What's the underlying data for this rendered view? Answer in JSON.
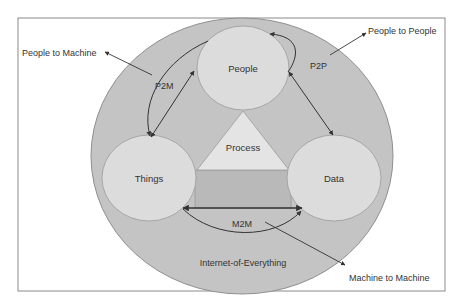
{
  "diagram": {
    "title": "Internet-of-Everything",
    "nodes": {
      "people": "People",
      "things": "Things",
      "data": "Data",
      "process": "Process"
    },
    "connections": {
      "p2m": "P2M",
      "p2p": "P2P",
      "m2m": "M2M"
    },
    "callouts": {
      "people_to_machine": "People to Machine",
      "people_to_people": "People to People",
      "machine_to_machine": "Machine to Machine"
    },
    "colors": {
      "background": "#ffffff",
      "frame": "#8a8a8a",
      "outer_ellipse": "#c4c4c4",
      "outer_stroke": "#8f8f8f",
      "node_fill": "#dcdcdc",
      "triangle_fill": "#e4e4e4",
      "rect_fill": "#b9b9b9",
      "arrow": "#333333",
      "text": "#333333"
    }
  }
}
